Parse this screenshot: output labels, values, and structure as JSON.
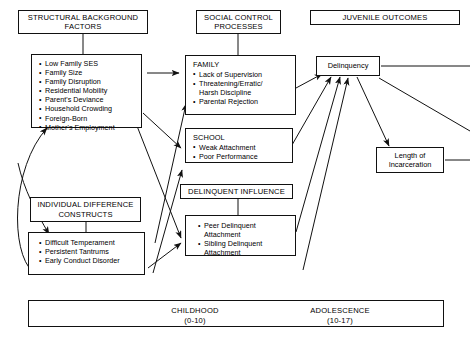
{
  "diagram": {
    "title_bars": {
      "structural": "STRUCTURAL BACKGROUND\nFACTORS",
      "social": "SOCIAL CONTROL\nPROCESSES",
      "juvenile": "JUVENILE OUTCOMES",
      "individual": "INDIVIDUAL DIFFERENCE\nCONSTRUCTS",
      "delinquent_influence": "DELINQUENT INFLUENCE"
    },
    "structural_factors": {
      "items": [
        "Low Family SES",
        "Family Size",
        "Family Disruption",
        "Residential Mobility",
        "Parent's Deviance",
        "Household Crowding",
        "Foreign-Born",
        "Mother's Employment"
      ]
    },
    "family": {
      "group_title": "FAMILY",
      "items": [
        "Lack of Supervision",
        "Threatening/Erratic/\nHarsh Discipline",
        "Parental Rejection"
      ]
    },
    "school": {
      "group_title": "SCHOOL",
      "items": [
        "Weak Attachment",
        "Poor Performance"
      ]
    },
    "delinquent_influence": {
      "items": [
        "Peer Delinquent\nAttachment",
        "Sibling Delinquent\nAttachment"
      ]
    },
    "individual_constructs": {
      "items": [
        "Difficult Temperament",
        "Persistent Tantrums",
        "Early Conduct Disorder"
      ]
    },
    "outcomes": {
      "delinquency": "Delinquency",
      "incarceration": "Length of\nIncarceration"
    },
    "timeline": {
      "childhood_label": "CHILDHOOD",
      "childhood_range": "(0-10)",
      "adolescence_label": "ADOLESCENCE",
      "adolescence_range": "(10-17)"
    },
    "colors": {
      "line": "#111111",
      "background": "#ffffff",
      "text": "#000000"
    }
  }
}
